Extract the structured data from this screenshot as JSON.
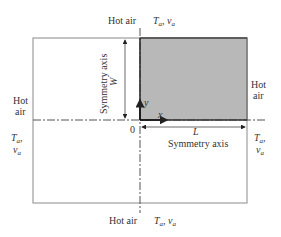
{
  "diagram": {
    "top": {
      "medium": "Hot air",
      "conditions": "T",
      "cond_sub": "a",
      "cond_sep": ", v",
      "cond_sub2": "a"
    },
    "bottom": {
      "medium": "Hot air",
      "conditions": "T",
      "cond_sub": "a",
      "cond_sep": ", v",
      "cond_sub2": "a"
    },
    "left": {
      "medium_line1": "Hot",
      "medium_line2": "air",
      "cond_line1": "T",
      "cond_line1_sub": "a",
      "cond_line1_sep": ",",
      "cond_line2": "v",
      "cond_line2_sub": "a"
    },
    "right": {
      "medium_line1": "Hot",
      "medium_line2": "air",
      "cond_line1": "T",
      "cond_line1_sub": "a",
      "cond_line1_sep": ",",
      "cond_line2": "v",
      "cond_line2_sub": "a"
    },
    "vertical_symmetry_label": "Symmetry axis",
    "horizontal_symmetry_label": "Symmetry axis",
    "width_dim": "W",
    "length_dim": "L",
    "origin": "0",
    "x_axis": "x",
    "y_axis": "y",
    "colors": {
      "shaded_region": "#b8b8b8",
      "outline": "#888888",
      "text": "#333333"
    }
  }
}
